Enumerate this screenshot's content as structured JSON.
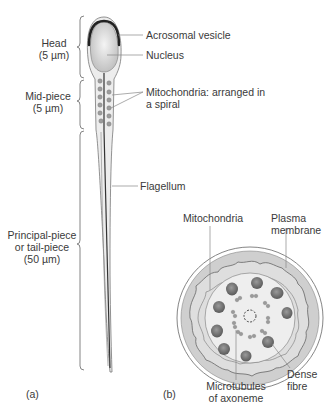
{
  "figure_a": {
    "panel_label": "(a)",
    "regions": [
      {
        "name": "Head",
        "size": "(5 µm)"
      },
      {
        "name": "Mid-piece",
        "size": "(5 µm)"
      },
      {
        "name_line1": "Principal-piece",
        "name_line2": "or tail-piece",
        "size": "(50 µm)"
      }
    ],
    "labels": {
      "acrosomal_vesicle": "Acrosomal vesicle",
      "nucleus": "Nucleus",
      "mitochondria_line1": "Mitochondria: arranged in",
      "mitochondria_line2": "a spiral",
      "flagellum": "Flagellum"
    }
  },
  "figure_b": {
    "panel_label": "(b)",
    "labels": {
      "mitochondria": "Mitochondria",
      "plasma_line1": "Plasma",
      "plasma_line2": "membrane",
      "dense_line1": "Dense",
      "dense_line2": "fibre",
      "micro_line1": "Microtubules",
      "micro_line2": "of axoneme"
    }
  },
  "colors": {
    "line": "#666666",
    "fill_light": "#e4e4e4",
    "fill_mid": "#c8c8c8",
    "dark": "#2a2a2a"
  }
}
